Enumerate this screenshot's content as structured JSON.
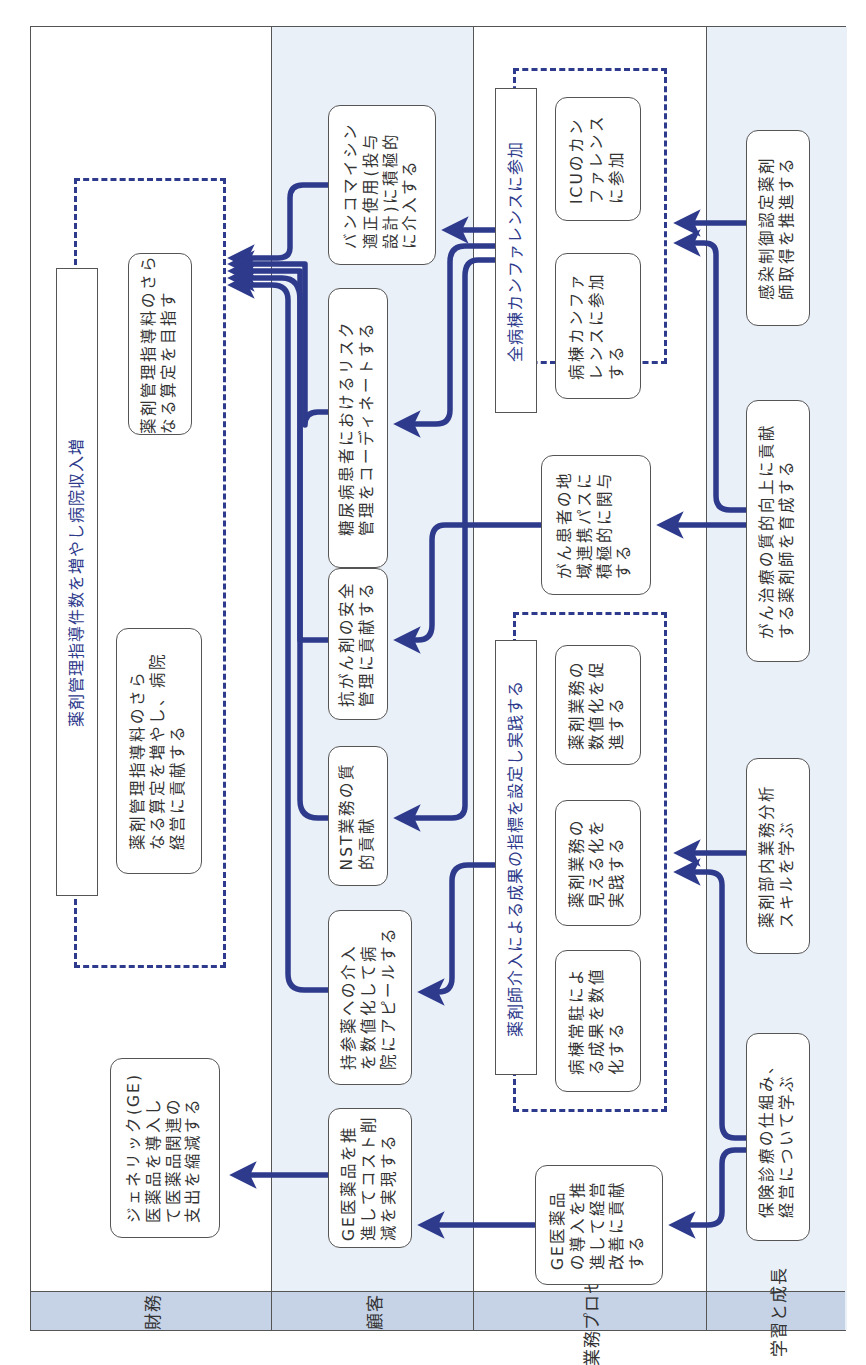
{
  "diagram": {
    "type": "balanced-scorecard-strategy-map",
    "orientation": "rotated-90-ccw",
    "accent_color": "#2e3a8c",
    "perspectives": [
      {
        "id": "financial",
        "label": "財務"
      },
      {
        "id": "customer",
        "label": "顧客"
      },
      {
        "id": "process",
        "label": "業務プロセス"
      },
      {
        "id": "learning",
        "label": "学習と成長"
      }
    ],
    "groups": {
      "revenue": {
        "title": "薬剤管理指導件数を増やし病院収入増"
      },
      "conference": {
        "title": "全病棟カンファレンスに参加"
      },
      "indicators": {
        "title": "薬剤師介入による成果の指標を設定し実践する"
      }
    },
    "nodes": {
      "fin_fee_goal": "薬剤管理指導料のさら\nなる算定を目指す",
      "fin_fee_contrib": "薬剤管理指導料のさら\nなる算定を増やし、病院\n経営に貢献する",
      "fin_generic": "ジェネリック(GE)\n医薬品を導入し\nて医薬品関連の\n支出を縮減する",
      "cus_vancomycin": "バンコマイシン\n適正使用(投与\n設計)に積極的\nに介入する",
      "cus_diabetes": "糖尿病患者におけるリスク\n管理をコーディネートする",
      "cus_anticancer": "抗がん剤の安全\n管理に貢献する",
      "cus_nst": "NST業務の質\n的貢献",
      "cus_brought_drugs": "持参薬への介入\nを数値化して病\n院にアピールする",
      "cus_ge_cost": "GE医薬品を推\n進してコスト削\n減を実現する",
      "pro_icu": "ICUのカン\nファレンス\nに参加",
      "pro_ward_conf": "病棟カンファ\nレンスに参加\nする",
      "pro_cancer_path": "がん患者の地\n域連携パスに\n積極的に関与\nする",
      "pro_promote_numbers": "薬剤業務の\n数値化を促\n進する",
      "pro_visualize": "薬剤業務の\n見える化を\n実践する",
      "pro_ward_resident": "病棟常駐によ\nる成果を数値\n化する",
      "pro_ge_mgmt": "GE医薬品\nの導入を推\n進して経営\n改善に貢献\nする",
      "lea_infection": "感染制御認定薬剤\n師取得を推進する",
      "lea_cancer_quality": "がん治療の質的向上に貢献\nする薬剤師を育成する",
      "lea_analysis": "薬剤部内業務分析\nスキルを学ぶ",
      "lea_insurance": "保険診療の仕組み、\n経営について学ぶ"
    },
    "edges": [
      {
        "from": "cus_vancomycin",
        "to": "revenue"
      },
      {
        "from": "cus_diabetes",
        "to": "revenue"
      },
      {
        "from": "cus_anticancer",
        "to": "revenue"
      },
      {
        "from": "cus_nst",
        "to": "revenue"
      },
      {
        "from": "cus_brought_drugs",
        "to": "revenue"
      },
      {
        "from": "cus_ge_cost",
        "to": "fin_generic"
      },
      {
        "from": "conference",
        "to": "cus_vancomycin"
      },
      {
        "from": "conference",
        "to": "cus_diabetes"
      },
      {
        "from": "conference",
        "to": "cus_nst"
      },
      {
        "from": "pro_cancer_path",
        "to": "cus_anticancer"
      },
      {
        "from": "indicators",
        "to": "cus_brought_drugs"
      },
      {
        "from": "pro_ge_mgmt",
        "to": "cus_ge_cost"
      },
      {
        "from": "lea_infection",
        "to": "conference"
      },
      {
        "from": "lea_cancer_quality",
        "to": "conference"
      },
      {
        "from": "lea_cancer_quality",
        "to": "pro_cancer_path"
      },
      {
        "from": "lea_analysis",
        "to": "indicators"
      },
      {
        "from": "lea_insurance",
        "to": "indicators"
      },
      {
        "from": "lea_insurance",
        "to": "pro_ge_mgmt"
      }
    ]
  }
}
